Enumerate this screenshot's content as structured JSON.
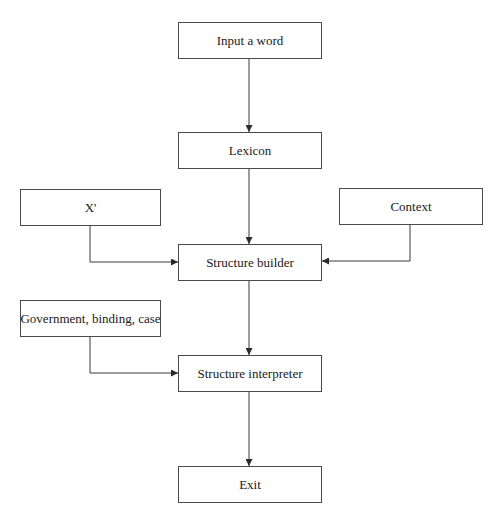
{
  "diagram": {
    "type": "flowchart",
    "nodes": [
      {
        "id": "input",
        "label": "Input a word"
      },
      {
        "id": "lexicon",
        "label": "Lexicon"
      },
      {
        "id": "xbar",
        "label": "X'"
      },
      {
        "id": "context",
        "label": "Context"
      },
      {
        "id": "builder",
        "label": "Structure builder"
      },
      {
        "id": "gbc",
        "label": "Government, binding, case"
      },
      {
        "id": "interpreter",
        "label": "Structure interpreter"
      },
      {
        "id": "exit",
        "label": "Exit"
      }
    ],
    "edges": [
      {
        "from": "input",
        "to": "lexicon"
      },
      {
        "from": "lexicon",
        "to": "builder"
      },
      {
        "from": "xbar",
        "to": "builder"
      },
      {
        "from": "context",
        "to": "builder"
      },
      {
        "from": "builder",
        "to": "interpreter"
      },
      {
        "from": "gbc",
        "to": "interpreter"
      },
      {
        "from": "interpreter",
        "to": "exit"
      }
    ],
    "colors": {
      "line": "#3a3a3a",
      "border": "#4a4a4a",
      "text": "#1a1a1a",
      "background": "#ffffff"
    }
  }
}
